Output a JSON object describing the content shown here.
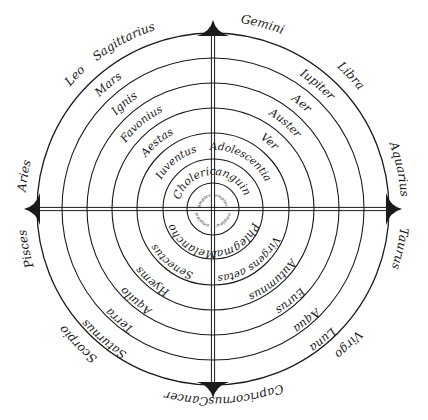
{
  "diagram": {
    "type": "concentric-wheel",
    "center": [
      213,
      209
    ],
    "ring_radii": [
      26,
      50,
      76,
      101,
      126,
      151,
      176
    ],
    "line_color": "#1a1a1a",
    "background": "#ffffff",
    "cardinal_points": [
      "top",
      "right",
      "bottom",
      "left"
    ],
    "rings": [
      {
        "name": "zodiac",
        "labels": [
          {
            "text": "Sagittarius",
            "angle": -118
          },
          {
            "text": "Leo",
            "angle": -136
          },
          {
            "text": "Aries",
            "angle": -170
          },
          {
            "text": "Gemini",
            "angle": -75
          },
          {
            "text": "Libra",
            "angle": -44
          },
          {
            "text": "Aquarius",
            "angle": -12
          },
          {
            "text": "Taurus",
            "angle": 12
          },
          {
            "text": "Virgo",
            "angle": 45
          },
          {
            "text": "Capricornus",
            "angle": 80
          },
          {
            "text": "Cancer",
            "angle": 98
          },
          {
            "text": "Scorpio",
            "angle": 135
          },
          {
            "text": "Pisces",
            "angle": 168
          }
        ]
      },
      {
        "name": "planets",
        "labels": [
          {
            "text": "Mars",
            "angle": -130
          },
          {
            "text": "Iupiter",
            "angle": -50
          },
          {
            "text": "Luna",
            "angle": 50
          },
          {
            "text": "Saturnus",
            "angle": 130
          }
        ]
      },
      {
        "name": "elements",
        "labels": [
          {
            "text": "Ignis",
            "angle": -130
          },
          {
            "text": "Aer",
            "angle": -50
          },
          {
            "text": "Aqua",
            "angle": 50
          },
          {
            "text": "Terra",
            "angle": 130
          }
        ]
      },
      {
        "name": "winds",
        "labels": [
          {
            "text": "Favonius",
            "angle": -130
          },
          {
            "text": "Auster",
            "angle": -50
          },
          {
            "text": "Eurus",
            "angle": 50
          },
          {
            "text": "Aquilo",
            "angle": 130
          }
        ]
      },
      {
        "name": "seasons",
        "labels": [
          {
            "text": "Aestas",
            "angle": -130
          },
          {
            "text": "Ver",
            "angle": -50
          },
          {
            "text": "Autumnus",
            "angle": 50
          },
          {
            "text": "Hyems",
            "angle": 130
          }
        ]
      },
      {
        "name": "ages",
        "labels": [
          {
            "text": "Iuventus",
            "angle": -128
          },
          {
            "text": "Adolescentia",
            "angle": -60
          },
          {
            "text": "Virgens aetas",
            "angle": 55
          },
          {
            "text": "Senectus",
            "angle": 128
          }
        ]
      },
      {
        "name": "humors",
        "labels": [
          {
            "text": "Choleric",
            "angle": -125
          },
          {
            "text": "Sanguine",
            "angle": -55
          },
          {
            "text": "Phlegmat",
            "angle": 55
          },
          {
            "text": "Melanchol",
            "angle": 125
          }
        ]
      },
      {
        "name": "center",
        "labels": [
          {
            "text": "Complexio",
            "angle": -135
          },
          {
            "text": "Complexio",
            "angle": -45
          },
          {
            "text": "Complexio",
            "angle": 45
          },
          {
            "text": "Complexio",
            "angle": 135
          }
        ]
      }
    ]
  }
}
